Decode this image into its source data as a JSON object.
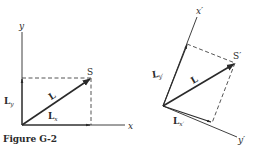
{
  "figure": {
    "caption": "Figure G-2",
    "left_diagram": {
      "axis_x_label": "x",
      "axis_y_label": "y",
      "point_label": "S",
      "vector_label": "L",
      "component_x_label": "L",
      "component_x_sub": "x",
      "component_y_label": "L",
      "component_y_sub": "y"
    },
    "right_diagram": {
      "axis_x_label": "x′",
      "axis_y_label": "y′",
      "point_label": "S′",
      "vector_label": "L",
      "component_x_label": "L",
      "component_x_sub": "x′",
      "component_y_label": "L",
      "component_y_sub": "y′"
    }
  },
  "colors": {
    "ink": "#2a2a2a",
    "background": "#ffffff"
  }
}
